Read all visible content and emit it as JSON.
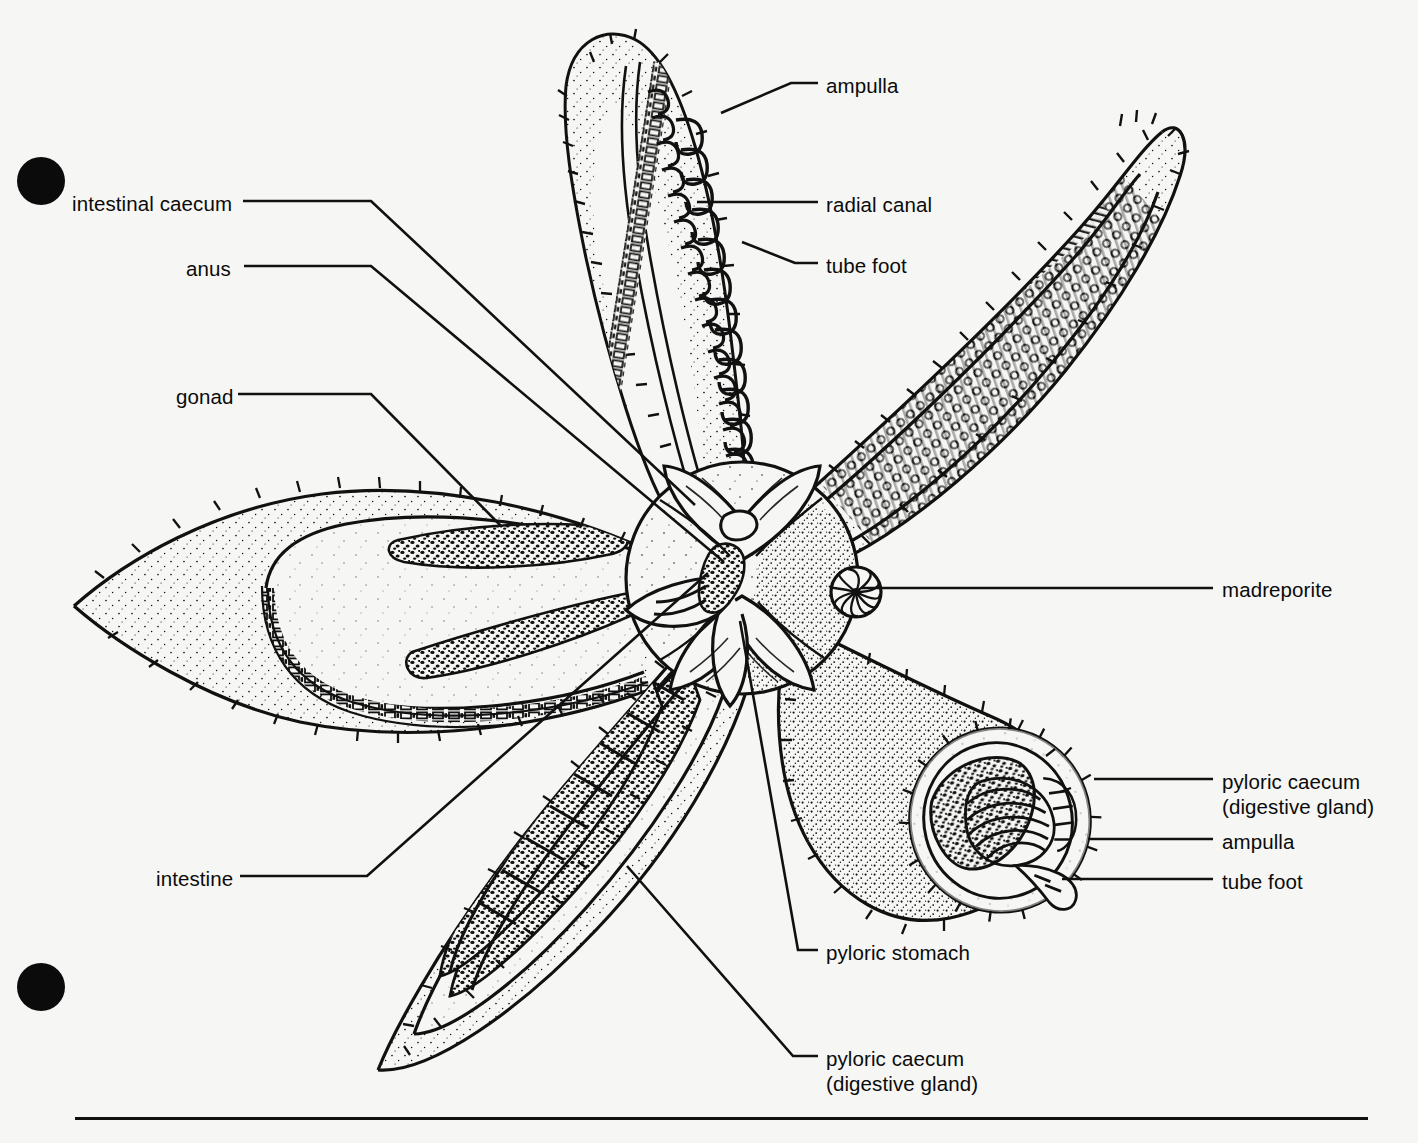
{
  "figure": {
    "view": "aboral dissection, five arms",
    "background_color": "#f6f6f4",
    "ink_color": "#111111"
  },
  "registration_marks": [
    {
      "name": "top-left-dot",
      "x": 17,
      "y": 157,
      "d": 48
    },
    {
      "name": "bottom-left-dot",
      "x": 17,
      "y": 963,
      "d": 48
    }
  ],
  "labels": {
    "left": [
      {
        "id": "intestinal-caecum",
        "text": "intestinal caecum",
        "x": 72,
        "y": 191,
        "align": "left"
      },
      {
        "id": "anus",
        "text": "anus",
        "x": 186,
        "y": 256,
        "align": "left"
      },
      {
        "id": "gonad",
        "text": "gonad",
        "x": 176,
        "y": 384,
        "align": "left"
      },
      {
        "id": "intestine",
        "text": "intestine",
        "x": 156,
        "y": 866,
        "align": "left"
      }
    ],
    "top_right": [
      {
        "id": "ampulla-top",
        "text": "ampulla",
        "x": 826,
        "y": 73
      },
      {
        "id": "radial-canal",
        "text": "radial canal",
        "x": 826,
        "y": 192
      },
      {
        "id": "tube-foot-top",
        "text": "tube foot",
        "x": 826,
        "y": 253
      }
    ],
    "right": [
      {
        "id": "madreporite",
        "text": "madreporite",
        "x": 1222,
        "y": 577
      },
      {
        "id": "pyloric-caecum-right",
        "text": "pyloric caecum\n(digestive gland)",
        "x": 1222,
        "y": 769
      },
      {
        "id": "ampulla-right",
        "text": "ampulla",
        "x": 1222,
        "y": 829
      },
      {
        "id": "tube-foot-right",
        "text": "tube foot",
        "x": 1222,
        "y": 869
      }
    ],
    "bottom": [
      {
        "id": "pyloric-stomach",
        "text": "pyloric stomach",
        "x": 826,
        "y": 940
      },
      {
        "id": "pyloric-caecum-bottom",
        "text": "pyloric caecum\n(digestive gland)",
        "x": 826,
        "y": 1046
      }
    ]
  },
  "leaders": [
    {
      "id": "leader-intestinal-caecum",
      "points": "243,201 371,201 695,505"
    },
    {
      "id": "leader-anus",
      "points": "244,266 371,266 724,562"
    },
    {
      "id": "leader-gonad",
      "points": "238,394 371,394 502,527"
    },
    {
      "id": "leader-intestine",
      "points": "240,876 367,876 708,573"
    },
    {
      "id": "leader-ampulla-top",
      "points": "818,83 791,83 721,113"
    },
    {
      "id": "leader-radial-canal",
      "points": "818,202 697,202"
    },
    {
      "id": "leader-tube-foot-top",
      "points": "818,263 795,263 742,242"
    },
    {
      "id": "leader-madreporite",
      "points": "1213,588 862,588"
    },
    {
      "id": "leader-pyloric-caecum-r",
      "points": "1213,779 1094,779"
    },
    {
      "id": "leader-ampulla-r",
      "points": "1213,839 1088,839"
    },
    {
      "id": "leader-tube-foot-r",
      "points": "1213,879 1062,879"
    },
    {
      "id": "leader-pyloric-stomach",
      "points": "818,950 798,950 740,621"
    },
    {
      "id": "leader-pyloric-caecum-b",
      "points": "818,1056 793,1056 627,866"
    }
  ],
  "footer_rule": {
    "x": 75,
    "y": 1117,
    "width": 1293,
    "height": 3
  },
  "anatomy_parts": [
    "top arm (opened, showing radial canal, tube feet, ampullae)",
    "upper-right arm (showing tube feet rows and ampullae in situ)",
    "left arm (opened, showing gonads and intestinal caecum)",
    "lower-left arm (opened, showing pyloric caeca / digestive glands)",
    "lower-right arm (cut transverse section showing pyloric caecum, ampulla, tube foot)",
    "central disc (pyloric stomach, anus, madreporite)"
  ]
}
